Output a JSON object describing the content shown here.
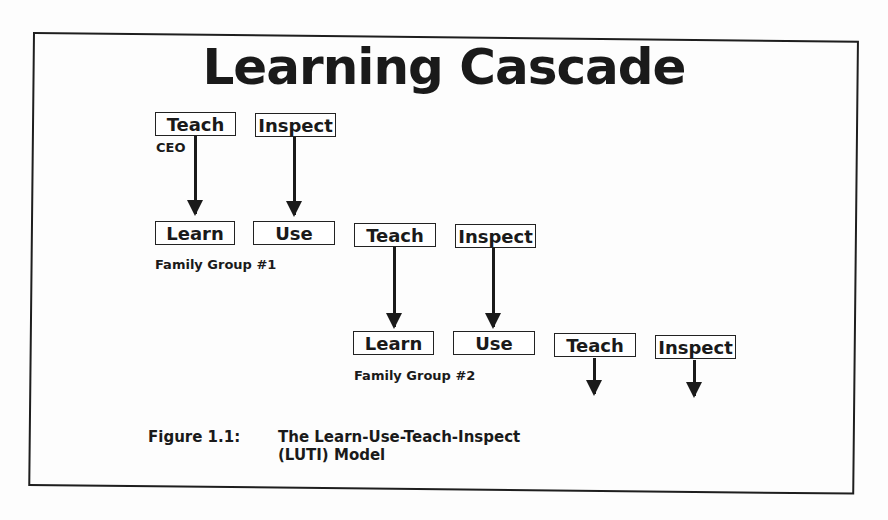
{
  "title": "Learning Cascade",
  "level0": {
    "teach": "Teach",
    "inspect": "Inspect",
    "label": "CEO"
  },
  "level1": {
    "learn": "Learn",
    "use": "Use",
    "teach": "Teach",
    "inspect": "Inspect",
    "label": "Family Group #1"
  },
  "level2": {
    "learn": "Learn",
    "use": "Use",
    "teach": "Teach",
    "inspect": "Inspect",
    "label": "Family Group #2"
  },
  "caption": {
    "number": "Figure  1.1:",
    "line1": "The Learn-Use-Teach-Inspect",
    "line2": "(LUTI) Model"
  }
}
